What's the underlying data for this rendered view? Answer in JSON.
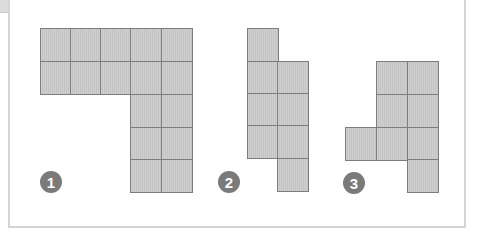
{
  "figure": {
    "colors": {
      "cell_fill": "#c9c9c9",
      "cell_border": "#7d7d7d",
      "badge": "#7a7a7a",
      "frame": "#d4d4d4"
    },
    "cell_size_px": [
      31,
      33
    ],
    "shapes": [
      {
        "label": "1",
        "badge_pos": [
          40,
          171
        ],
        "cells": [
          [
            40,
            28
          ],
          [
            70,
            28
          ],
          [
            100,
            28
          ],
          [
            130,
            28
          ],
          [
            161,
            28
          ],
          [
            40,
            61
          ],
          [
            70,
            61
          ],
          [
            100,
            61
          ],
          [
            130,
            61
          ],
          [
            161,
            61
          ],
          [
            130,
            94
          ],
          [
            161,
            94
          ],
          [
            130,
            127
          ],
          [
            161,
            127
          ],
          [
            130,
            159
          ],
          [
            161,
            159
          ]
        ]
      },
      {
        "label": "2",
        "badge_pos": [
          218,
          171
        ],
        "cells": [
          [
            247,
            28
          ],
          [
            247,
            61
          ],
          [
            277,
            61
          ],
          [
            247,
            93
          ],
          [
            277,
            93
          ],
          [
            247,
            125
          ],
          [
            277,
            125
          ],
          [
            277,
            158
          ]
        ]
      },
      {
        "label": "3",
        "badge_pos": [
          343,
          172
        ],
        "cells": [
          [
            376,
            61
          ],
          [
            407,
            61
          ],
          [
            376,
            94
          ],
          [
            407,
            94
          ],
          [
            345,
            127
          ],
          [
            376,
            127
          ],
          [
            407,
            127
          ],
          [
            407,
            159
          ]
        ]
      }
    ]
  }
}
